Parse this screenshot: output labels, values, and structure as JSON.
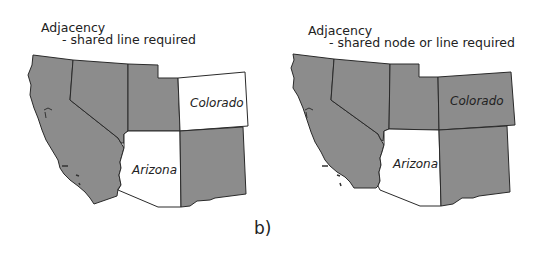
{
  "figure": {
    "caption": "b)"
  },
  "panels": [
    {
      "title": "Adjacency",
      "subtitle": "- shared line required",
      "labels": {
        "colorado": "Colorado",
        "arizona": "Arizona"
      },
      "fills": {
        "california": "#8c8c8c",
        "nevada": "#8c8c8c",
        "utah": "#8c8c8c",
        "colorado": "#ffffff",
        "arizona": "#ffffff",
        "new_mexico": "#8c8c8c"
      }
    },
    {
      "title": "Adjacency",
      "subtitle": "- shared node or line required",
      "labels": {
        "colorado": "Colorado",
        "arizona": "Arizona"
      },
      "fills": {
        "california": "#8c8c8c",
        "nevada": "#8c8c8c",
        "utah": "#8c8c8c",
        "colorado": "#8c8c8c",
        "arizona": "#ffffff",
        "new_mexico": "#8c8c8c"
      }
    }
  ],
  "colors": {
    "selected_neighbor": "#8c8c8c",
    "unselected": "#ffffff",
    "border": "#2a2a2a"
  }
}
